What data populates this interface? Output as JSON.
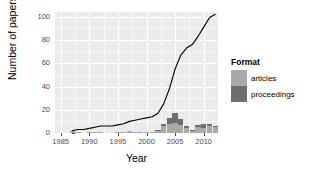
{
  "chart_data": {
    "type": "bar",
    "title": "",
    "subtitle": "",
    "xlabel": "Year",
    "ylabel": "Number of papers",
    "xlim": [
      1984,
      2012.5
    ],
    "ylim": [
      0,
      104
    ],
    "grid": true,
    "legend_position": "right",
    "x_ticks": [
      "1985",
      "1990",
      "1995",
      "2000",
      "2005",
      "2010"
    ],
    "x_tick_values": [
      1985,
      1990,
      1995,
      2000,
      2005,
      2010
    ],
    "y_ticks": [
      "0",
      "20",
      "40",
      "60",
      "80",
      "100"
    ],
    "y_tick_values": [
      0,
      20,
      40,
      60,
      80,
      100
    ],
    "categories": [
      1987,
      1988,
      1989,
      1990,
      1991,
      1992,
      1993,
      1994,
      1995,
      1996,
      1997,
      1998,
      1999,
      2000,
      2001,
      2002,
      2003,
      2004,
      2005,
      2006,
      2007,
      2008,
      2009,
      2010,
      2011,
      2012
    ],
    "series": [
      {
        "name": "articles",
        "color": "#a9a9a9",
        "values": [
          2,
          1,
          0,
          1,
          1,
          1,
          0,
          0,
          1,
          1,
          2,
          1,
          1,
          1,
          1,
          2,
          6,
          8,
          9,
          7,
          4,
          2,
          5,
          4,
          6,
          5
        ]
      },
      {
        "name": "proceedings",
        "color": "#6e6e6e",
        "values": [
          0,
          0,
          0,
          0,
          0,
          0,
          0,
          0,
          0,
          0,
          0,
          0,
          0,
          0,
          0,
          1,
          2,
          5,
          8,
          5,
          2,
          1,
          2,
          4,
          2,
          1
        ]
      }
    ],
    "cumulative_line": {
      "name": "cumulative total",
      "color": "#000000",
      "x": [
        1987,
        1988,
        1989,
        1990,
        1991,
        1992,
        1993,
        1994,
        1995,
        1996,
        1997,
        1998,
        1999,
        2000,
        2001,
        2002,
        2003,
        2004,
        2005,
        2006,
        2007,
        2008,
        2009,
        2010,
        2011,
        2012
      ],
      "y": [
        2,
        3,
        3,
        4,
        5,
        6,
        6,
        6,
        7,
        8,
        10,
        11,
        12,
        13,
        14,
        17,
        25,
        38,
        55,
        67,
        73,
        76,
        83,
        91,
        99,
        102
      ]
    }
  },
  "axes": {
    "y_title": "Number of papers",
    "x_title": "Year",
    "y_tick_labels": [
      "0",
      "20",
      "40",
      "60",
      "80",
      "100"
    ],
    "x_tick_labels": [
      "1985",
      "1990",
      "1995",
      "2000",
      "2005",
      "2010"
    ]
  },
  "legend": {
    "title": "Format",
    "items": [
      {
        "label": "articles",
        "color": "#a9a9a9"
      },
      {
        "label": "proceedings",
        "color": "#6e6e6e"
      }
    ]
  },
  "theme": {
    "panel_background": "#ebebeb",
    "grid_major_color": "#ffffff",
    "grid_minor_color": "#f7f7f7",
    "line_color": "#000000",
    "tick_label_color": "#4d4d4d",
    "text_color": "#000000"
  }
}
